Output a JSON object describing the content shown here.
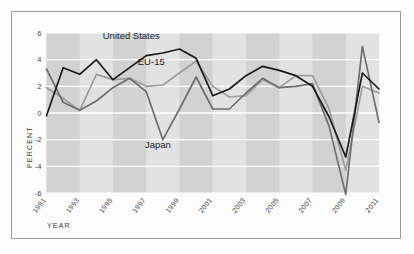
{
  "chart_data": {
    "type": "line",
    "title": "",
    "xlabel": "YEAR",
    "ylabel": "PERCENT",
    "x": [
      1991,
      1992,
      1993,
      1994,
      1995,
      1996,
      1997,
      1998,
      1999,
      2000,
      2001,
      2002,
      2003,
      2004,
      2005,
      2006,
      2007,
      2008,
      2009,
      2010,
      2011
    ],
    "xlim": [
      1991,
      2011
    ],
    "ylim": [
      -6,
      6
    ],
    "ytick_labels": [
      "6",
      "4",
      "2",
      "0",
      "-2",
      "-4",
      "-6"
    ],
    "ytick_values": [
      6,
      4,
      2,
      0,
      -2,
      -4,
      -6
    ],
    "xtick_labels": [
      "1991",
      "1993",
      "1995",
      "1997",
      "1999",
      "2001",
      "2003",
      "2005",
      "2007",
      "2009",
      "2011"
    ],
    "xtick_values": [
      1991,
      1993,
      1995,
      1997,
      1999,
      2001,
      2003,
      2005,
      2007,
      2009,
      2011
    ],
    "grid": "horizontal-white-gridlines-with-alternating-vertical-bands",
    "legend_position": "inline-annotations",
    "series": [
      {
        "name": "United States",
        "color": "#1a1a1a",
        "label_x": 1996.1,
        "label_y": 5.55,
        "values": [
          -0.2,
          3.4,
          2.9,
          4.0,
          2.5,
          3.4,
          4.3,
          4.5,
          4.8,
          4.1,
          1.3,
          1.8,
          2.8,
          3.5,
          3.2,
          2.8,
          2.0,
          -0.3,
          -3.3,
          3.0,
          1.8
        ]
      },
      {
        "name": "EU-15",
        "color": "#9d9d9d",
        "label_x": 1997.3,
        "label_y": 3.6,
        "values": [
          1.9,
          1.1,
          0.2,
          2.9,
          2.5,
          2.6,
          2.0,
          2.1,
          3.0,
          3.9,
          2.0,
          1.2,
          1.3,
          2.5,
          1.9,
          2.8,
          2.8,
          0.3,
          -4.3,
          2.0,
          1.5
        ]
      },
      {
        "name": "Japan",
        "color": "#6e6e6e",
        "label_x": 1997.7,
        "label_y": -2.6,
        "values": [
          3.3,
          0.8,
          0.2,
          0.9,
          1.9,
          2.6,
          1.6,
          -2.0,
          0.3,
          2.7,
          0.3,
          0.3,
          1.5,
          2.6,
          1.9,
          2.0,
          2.2,
          -1.0,
          -6.1,
          5.0,
          -0.7
        ]
      }
    ]
  },
  "annotations": {
    "united_states": "United States",
    "eu15": "EU-15",
    "japan": "Japan"
  }
}
